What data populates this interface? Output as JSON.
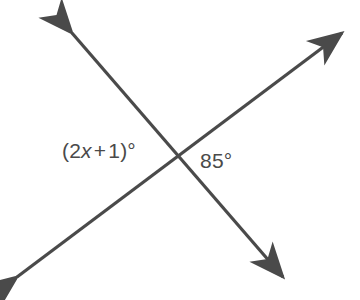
{
  "figure": {
    "name": "intersecting-lines-vertical-angles-diagram",
    "background_color": "#ffffff",
    "stroke_color": "#4a4a4a",
    "text_color": "#4a4a4a",
    "width": 360,
    "height": 300
  },
  "labels": {
    "left_angle": {
      "full_text": "(2x + 1)°",
      "open_paren": "(",
      "coefficient": "2",
      "variable": "x",
      "operator": "+",
      "constant": "1",
      "close_paren": ")",
      "degree_symbol": "°"
    },
    "right_angle": {
      "full_text": "85°",
      "value": "85",
      "degree_symbol": "°"
    }
  },
  "geometry": {
    "intersection": {
      "x": 178,
      "y": 158
    },
    "line_1": {
      "name": "line-falling",
      "from": {
        "x": 72,
        "y": 33
      },
      "to": {
        "x": 283,
        "y": 277
      },
      "arrow_start": "arrowhead-up-left",
      "arrow_end": "arrowhead-down-right"
    },
    "line_2": {
      "name": "line-rising",
      "from": {
        "x": 17,
        "y": 277
      },
      "to": {
        "x": 342,
        "y": 33
      },
      "arrow_start": "arrowhead-down-left",
      "arrow_end": "arrowhead-up-right"
    }
  }
}
